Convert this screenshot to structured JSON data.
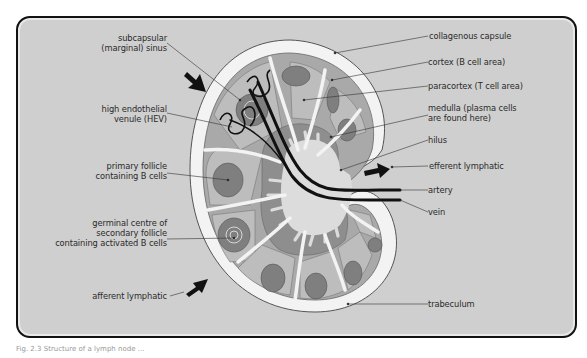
{
  "figure": {
    "colors": {
      "background": "#cfcfcf",
      "capsule": "#f2f2f2",
      "cortex": "#a8a8a8",
      "paracortex": "#bdbdbd",
      "follicle": "#7e7e7e",
      "medulla": "#8e8e8e",
      "vessel": "#111111"
    },
    "labels_left": [
      {
        "id": "subcapsular-sinus",
        "text": [
          "subcapsular",
          "(marginal) sinus"
        ]
      },
      {
        "id": "hev",
        "text": [
          "high endothelial",
          "venule (HEV)"
        ]
      },
      {
        "id": "primary-follicle",
        "text": [
          "primary follicle",
          "containing B cells"
        ]
      },
      {
        "id": "germinal-centre",
        "text": [
          "germinal centre  of",
          "secondary follicle",
          "containing activated B cells"
        ]
      },
      {
        "id": "afferent-lymphatic",
        "text": [
          "afferent lymphatic"
        ]
      }
    ],
    "labels_right": [
      {
        "id": "collagenous-capsule",
        "text": [
          "collagenous capsule"
        ]
      },
      {
        "id": "cortex",
        "text": [
          "cortex (B cell area)"
        ]
      },
      {
        "id": "paracortex",
        "text": [
          "paracortex (T cell area)"
        ]
      },
      {
        "id": "medulla",
        "text": [
          "medulla (plasma cells",
          "are found  here)"
        ]
      },
      {
        "id": "hilus",
        "text": [
          "hilus"
        ]
      },
      {
        "id": "efferent-lymphatic",
        "text": [
          "efferent lymphatic"
        ]
      },
      {
        "id": "artery",
        "text": [
          "artery"
        ]
      },
      {
        "id": "vein",
        "text": [
          "vein"
        ]
      },
      {
        "id": "trabeculum",
        "text": [
          "trabeculum"
        ]
      }
    ],
    "caption": "Fig. 2.3  Structure of a lymph node ..."
  }
}
